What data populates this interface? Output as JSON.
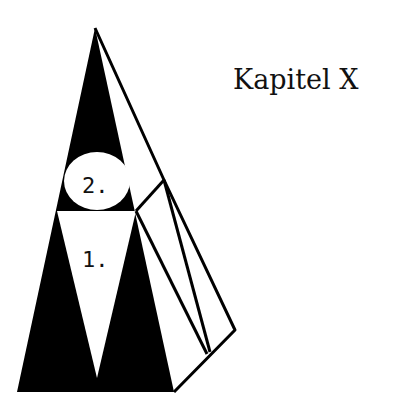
{
  "title": "Kapitel X",
  "diagram": {
    "type": "pyramid-figure",
    "labels": {
      "circle": "2.",
      "triangle": "1."
    },
    "colors": {
      "fill": "#000000",
      "background": "#ffffff"
    }
  }
}
